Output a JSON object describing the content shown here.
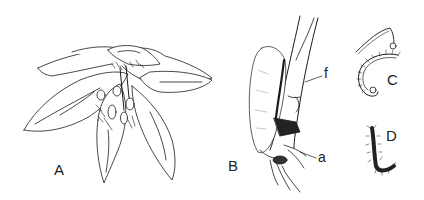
{
  "figure": {
    "panels": [
      {
        "id": "A",
        "label": "A",
        "subject": "flower with spreading petals/sepals, top view"
      },
      {
        "id": "B",
        "label": "B",
        "subject": "insect with folded wing on stem"
      },
      {
        "id": "C",
        "label": "C",
        "subject": "curved segmented appendage with hairs"
      },
      {
        "id": "D",
        "label": "D",
        "subject": "hairy curved appendage"
      }
    ],
    "annotations": [
      {
        "label": "f",
        "panel": "B"
      },
      {
        "label": "a",
        "panel": "B"
      }
    ],
    "line_color": "#1a1a1a",
    "background": "#ffffff"
  }
}
